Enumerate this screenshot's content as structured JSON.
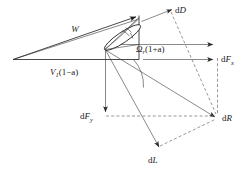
{
  "figure": {
    "type": "vector-force-diagram",
    "labels": {
      "relative_velocity": "W",
      "axial_velocity": "V",
      "axial_velocity_sub": "1",
      "axial_velocity_tail": "(1−a)",
      "tangential_velocity": "Ω",
      "tangential_velocity_sub": "r",
      "tangential_velocity_tail": "(1+a)",
      "drag": "d",
      "drag_sym": "D",
      "lift": "d",
      "lift_sym": "L",
      "resultant": "d",
      "resultant_sym": "R",
      "force_x": "d",
      "force_x_sym": "F",
      "force_x_sub": "x",
      "force_y": "d",
      "force_y_sym": "F",
      "force_y_sub": "y"
    },
    "colors": {
      "stroke": "#1a1a1a",
      "thin_stroke": "#3a3a3a",
      "dashed_stroke": "#6b6b6b",
      "background": "#ffffff"
    }
  }
}
